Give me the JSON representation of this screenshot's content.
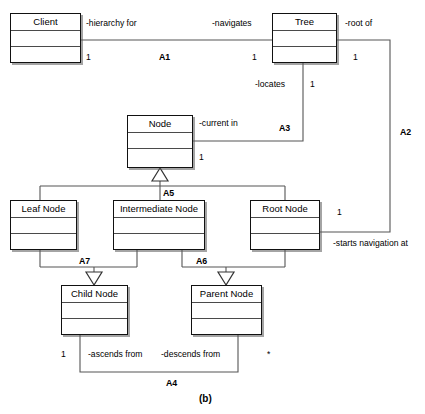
{
  "diagram": {
    "caption": "(b)",
    "classes": [
      {
        "id": "client",
        "name": "Client",
        "x": 10,
        "y": 13,
        "w": 71,
        "h": 50
      },
      {
        "id": "tree",
        "name": "Tree",
        "x": 272,
        "y": 13,
        "w": 65,
        "h": 50
      },
      {
        "id": "node",
        "name": "Node",
        "x": 127,
        "y": 115,
        "w": 66,
        "h": 53
      },
      {
        "id": "leaf-node",
        "name": "Leaf Node",
        "x": 10,
        "y": 200,
        "w": 67,
        "h": 50
      },
      {
        "id": "intermediate-node",
        "name": "Intermediate Node",
        "x": 113,
        "y": 200,
        "w": 92,
        "h": 50
      },
      {
        "id": "root-node",
        "name": "Root Node",
        "x": 250,
        "y": 200,
        "w": 70,
        "h": 50
      },
      {
        "id": "child-node",
        "name": "Child Node",
        "x": 61,
        "y": 285,
        "w": 67,
        "h": 50
      },
      {
        "id": "parent-node",
        "name": "Parent Node",
        "x": 191,
        "y": 285,
        "w": 71,
        "h": 50
      }
    ],
    "associations": [
      {
        "id": "a1",
        "label": "A1",
        "role_source": "-hierarchy for",
        "role_target": "-navigates"
      },
      {
        "id": "a2",
        "label": "A2",
        "role_source": "-root of",
        "role_target": "-starts navigation at"
      },
      {
        "id": "a3",
        "label": "A3",
        "role_source": "-locates",
        "role_target": "-current in"
      },
      {
        "id": "a4",
        "label": "A4",
        "role_source": "-ascends from",
        "role_target": "-descends from"
      },
      {
        "id": "a5",
        "label": "A5"
      },
      {
        "id": "a6",
        "label": "A6"
      },
      {
        "id": "a7",
        "label": "A7"
      }
    ],
    "role_labels": {
      "hierarchy_for": "-hierarchy for",
      "navigates": "-navigates",
      "root_of": "-root of",
      "locates": "-locates",
      "current_in": "-current in",
      "starts_navigation_at": "-starts navigation at",
      "ascends_from": "-ascends from",
      "descends_from": "-descends from"
    },
    "association_labels": {
      "a1": "A1",
      "a2": "A2",
      "a3": "A3",
      "a4": "A4",
      "a5": "A5",
      "a6": "A6",
      "a7": "A7"
    },
    "multiplicities": {
      "client_one": "1",
      "tree_left_one": "1",
      "tree_right_one": "1",
      "tree_bottom_one": "1",
      "node_one": "1",
      "root_node_one": "1",
      "child_node_one": "1",
      "parent_node_many": "*"
    },
    "colors": {
      "line": "#555555",
      "border": "#111111",
      "background": "#ffffff",
      "text": "#000000"
    }
  }
}
